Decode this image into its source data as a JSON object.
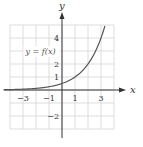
{
  "chart_data": {
    "type": "line",
    "title": "",
    "xlabel": "x",
    "ylabel": "y",
    "xlim": [
      -4,
      4
    ],
    "ylim": [
      -3,
      5
    ],
    "grid": true,
    "x_ticks": [
      {
        "value": -3,
        "label": "−3"
      },
      {
        "value": -1,
        "label": "−1"
      },
      {
        "value": 1,
        "label": "1"
      },
      {
        "value": 3,
        "label": "3"
      }
    ],
    "y_ticks": [
      {
        "value": 1,
        "label": "1"
      },
      {
        "value": 2,
        "label": "2"
      },
      {
        "value": 3,
        "label": "3"
      },
      {
        "value": 4,
        "label": "4"
      },
      {
        "value": -2,
        "label": "−2"
      }
    ],
    "series": [
      {
        "name": "y = f(x)",
        "function": "0.5*2^x",
        "x": [
          -4,
          -3,
          -2,
          -1,
          0,
          1,
          2,
          3,
          3.3
        ],
        "y": [
          0.03,
          0.06,
          0.13,
          0.25,
          0.5,
          1,
          2,
          4,
          4.9
        ]
      }
    ],
    "annotations": [
      {
        "text": "y = f(x)",
        "x": -2.5,
        "y": 3
      }
    ]
  }
}
